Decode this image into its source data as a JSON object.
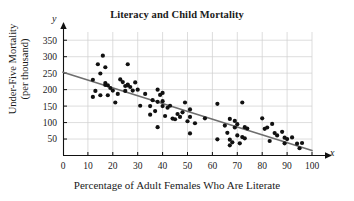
{
  "chart_data": {
    "type": "scatter",
    "title": "Literacy and Child Mortality",
    "xlabel": "Percentage of Adult Females Who Are Literate",
    "ylabel": "Under-Five Mortality (per thousand)",
    "ylabel_line1": "Under-Five Mortality",
    "ylabel_line2": "(per thousand)",
    "x_symbol": "x",
    "y_symbol": "y",
    "xlim": [
      0,
      100
    ],
    "ylim": [
      0,
      375
    ],
    "xticks": [
      0,
      10,
      20,
      30,
      40,
      50,
      60,
      70,
      80,
      90,
      100
    ],
    "yticks": [
      50,
      100,
      150,
      200,
      250,
      300,
      350
    ],
    "grid": true,
    "legend": "none",
    "marker": "filled-circle",
    "marker_color": "#111111",
    "trendline": {
      "label": "least-squares regression line",
      "color": "#6e6e6e",
      "x_start": 0,
      "y_start": 253,
      "x_end": 100,
      "y_end": 15
    },
    "points": [
      [
        12,
        230
      ],
      [
        12,
        178
      ],
      [
        13,
        196
      ],
      [
        14,
        277
      ],
      [
        15,
        183
      ],
      [
        15,
        249
      ],
      [
        16,
        303
      ],
      [
        17,
        214
      ],
      [
        17,
        268
      ],
      [
        17,
        220
      ],
      [
        18,
        213
      ],
      [
        18,
        183
      ],
      [
        19,
        205
      ],
      [
        20,
        197
      ],
      [
        21,
        161
      ],
      [
        22,
        187
      ],
      [
        23,
        231
      ],
      [
        24,
        223
      ],
      [
        25,
        211
      ],
      [
        25,
        196
      ],
      [
        26,
        215
      ],
      [
        26,
        277
      ],
      [
        26,
        213
      ],
      [
        27,
        208
      ],
      [
        28,
        197
      ],
      [
        29,
        222
      ],
      [
        30,
        200
      ],
      [
        31,
        151
      ],
      [
        33,
        187
      ],
      [
        35,
        150
      ],
      [
        35,
        124
      ],
      [
        36,
        168
      ],
      [
        37,
        135
      ],
      [
        38,
        86
      ],
      [
        38,
        200
      ],
      [
        38,
        163
      ],
      [
        39,
        184
      ],
      [
        40,
        150
      ],
      [
        40,
        190
      ],
      [
        40,
        165
      ],
      [
        41,
        120
      ],
      [
        42,
        145
      ],
      [
        43,
        151
      ],
      [
        44,
        112
      ],
      [
        45,
        110
      ],
      [
        46,
        126
      ],
      [
        47,
        117
      ],
      [
        48,
        131
      ],
      [
        49,
        161
      ],
      [
        50,
        104
      ],
      [
        51,
        140
      ],
      [
        51,
        117
      ],
      [
        51,
        67
      ],
      [
        53,
        98
      ],
      [
        57,
        113
      ],
      [
        62,
        157
      ],
      [
        62,
        49
      ],
      [
        65,
        91
      ],
      [
        66,
        69
      ],
      [
        67,
        111
      ],
      [
        67,
        48
      ],
      [
        67,
        31
      ],
      [
        68,
        40
      ],
      [
        69,
        105
      ],
      [
        69,
        85
      ],
      [
        70,
        95
      ],
      [
        70,
        61
      ],
      [
        71,
        37
      ],
      [
        72,
        161
      ],
      [
        72,
        56
      ],
      [
        73,
        86
      ],
      [
        73,
        52
      ],
      [
        74,
        82
      ],
      [
        80,
        113
      ],
      [
        81,
        81
      ],
      [
        82,
        85
      ],
      [
        83,
        44
      ],
      [
        84,
        96
      ],
      [
        85,
        68
      ],
      [
        86,
        61
      ],
      [
        88,
        72
      ],
      [
        89,
        54
      ],
      [
        89,
        37
      ],
      [
        90,
        50
      ],
      [
        92,
        55
      ],
      [
        94,
        36
      ],
      [
        95,
        22
      ],
      [
        96,
        38
      ]
    ]
  }
}
